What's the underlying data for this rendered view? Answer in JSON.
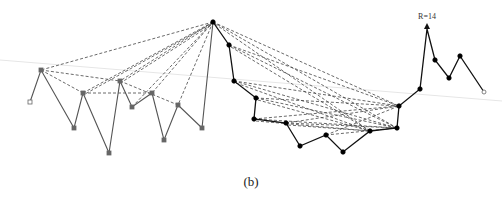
{
  "figure": {
    "caption": "(b)",
    "annotation": {
      "text": "R=14",
      "x": 427,
      "y": 19
    },
    "colors": {
      "left_chain": "#555555",
      "right_chain": "#111111",
      "dashed": "#444444",
      "baseline": "#e6e6e6",
      "left_node": "#666666",
      "right_node": "#000000"
    },
    "baseline": [
      [
        0,
        60
      ],
      [
        502,
        101
      ]
    ],
    "left_chain": [
      [
        30,
        102
      ],
      [
        41,
        70
      ],
      [
        74,
        128
      ],
      [
        83,
        93
      ],
      [
        109,
        153
      ],
      [
        120,
        81
      ],
      [
        132,
        107
      ],
      [
        152,
        93
      ],
      [
        164,
        140
      ],
      [
        178,
        105
      ],
      [
        202,
        128
      ],
      [
        213,
        22
      ]
    ],
    "right_chain": [
      [
        213,
        22
      ],
      [
        229,
        45
      ],
      [
        234,
        81
      ],
      [
        256,
        98
      ],
      [
        254,
        119
      ],
      [
        286,
        123
      ],
      [
        300,
        146
      ],
      [
        326,
        135
      ],
      [
        343,
        152
      ],
      [
        370,
        131
      ],
      [
        397,
        128
      ],
      [
        399,
        106
      ],
      [
        420,
        89
      ],
      [
        427,
        29
      ],
      [
        435,
        60
      ],
      [
        449,
        78
      ],
      [
        460,
        56
      ],
      [
        484,
        92
      ]
    ],
    "hollow_nodes": [
      [
        30,
        102
      ],
      [
        484,
        92
      ]
    ],
    "left_dashed": [
      [
        [
          213,
          22
        ],
        [
          41,
          70
        ]
      ],
      [
        [
          213,
          22
        ],
        [
          83,
          93
        ]
      ],
      [
        [
          211,
          24
        ],
        [
          85,
          94
        ]
      ],
      [
        [
          213,
          22
        ],
        [
          120,
          81
        ]
      ],
      [
        [
          211,
          25
        ],
        [
          122,
          82
        ]
      ],
      [
        [
          213,
          22
        ],
        [
          152,
          93
        ]
      ],
      [
        [
          213,
          22
        ],
        [
          178,
          105
        ]
      ],
      [
        [
          41,
          70
        ],
        [
          120,
          81
        ]
      ],
      [
        [
          41,
          70
        ],
        [
          83,
          93
        ]
      ],
      [
        [
          83,
          93
        ],
        [
          152,
          93
        ]
      ],
      [
        [
          120,
          81
        ],
        [
          178,
          105
        ]
      ],
      [
        [
          132,
          107
        ],
        [
          213,
          22
        ]
      ]
    ],
    "right_dashed": [
      [
        [
          213,
          22
        ],
        [
          399,
          106
        ]
      ],
      [
        [
          213,
          22
        ],
        [
          397,
          128
        ]
      ],
      [
        [
          215,
          24
        ],
        [
          370,
          131
        ]
      ],
      [
        [
          229,
          45
        ],
        [
          399,
          106
        ]
      ],
      [
        [
          229,
          45
        ],
        [
          397,
          128
        ]
      ],
      [
        [
          231,
          47
        ],
        [
          370,
          131
        ]
      ],
      [
        [
          234,
          81
        ],
        [
          399,
          106
        ]
      ],
      [
        [
          234,
          81
        ],
        [
          397,
          128
        ]
      ],
      [
        [
          236,
          83
        ],
        [
          370,
          131
        ]
      ],
      [
        [
          256,
          98
        ],
        [
          399,
          106
        ]
      ],
      [
        [
          256,
          98
        ],
        [
          397,
          128
        ]
      ],
      [
        [
          258,
          100
        ],
        [
          370,
          131
        ]
      ],
      [
        [
          254,
          119
        ],
        [
          399,
          106
        ]
      ],
      [
        [
          254,
          119
        ],
        [
          397,
          128
        ]
      ],
      [
        [
          256,
          121
        ],
        [
          370,
          131
        ]
      ],
      [
        [
          286,
          123
        ],
        [
          399,
          106
        ]
      ],
      [
        [
          286,
          123
        ],
        [
          397,
          128
        ]
      ],
      [
        [
          288,
          125
        ],
        [
          370,
          131
        ]
      ],
      [
        [
          326,
          135
        ],
        [
          399,
          106
        ]
      ],
      [
        [
          326,
          135
        ],
        [
          397,
          128
        ]
      ]
    ]
  }
}
